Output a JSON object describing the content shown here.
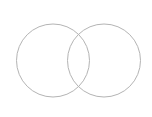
{
  "diagram": {
    "type": "venn",
    "stroke_color": "#b4b4b4",
    "stroke_width": 1,
    "circles": [
      {
        "name": "left-circle",
        "cx": 53,
        "cy": 60.5,
        "r": 36.5
      },
      {
        "name": "right-circle",
        "cx": 104,
        "cy": 60.5,
        "r": 36.5
      }
    ]
  }
}
